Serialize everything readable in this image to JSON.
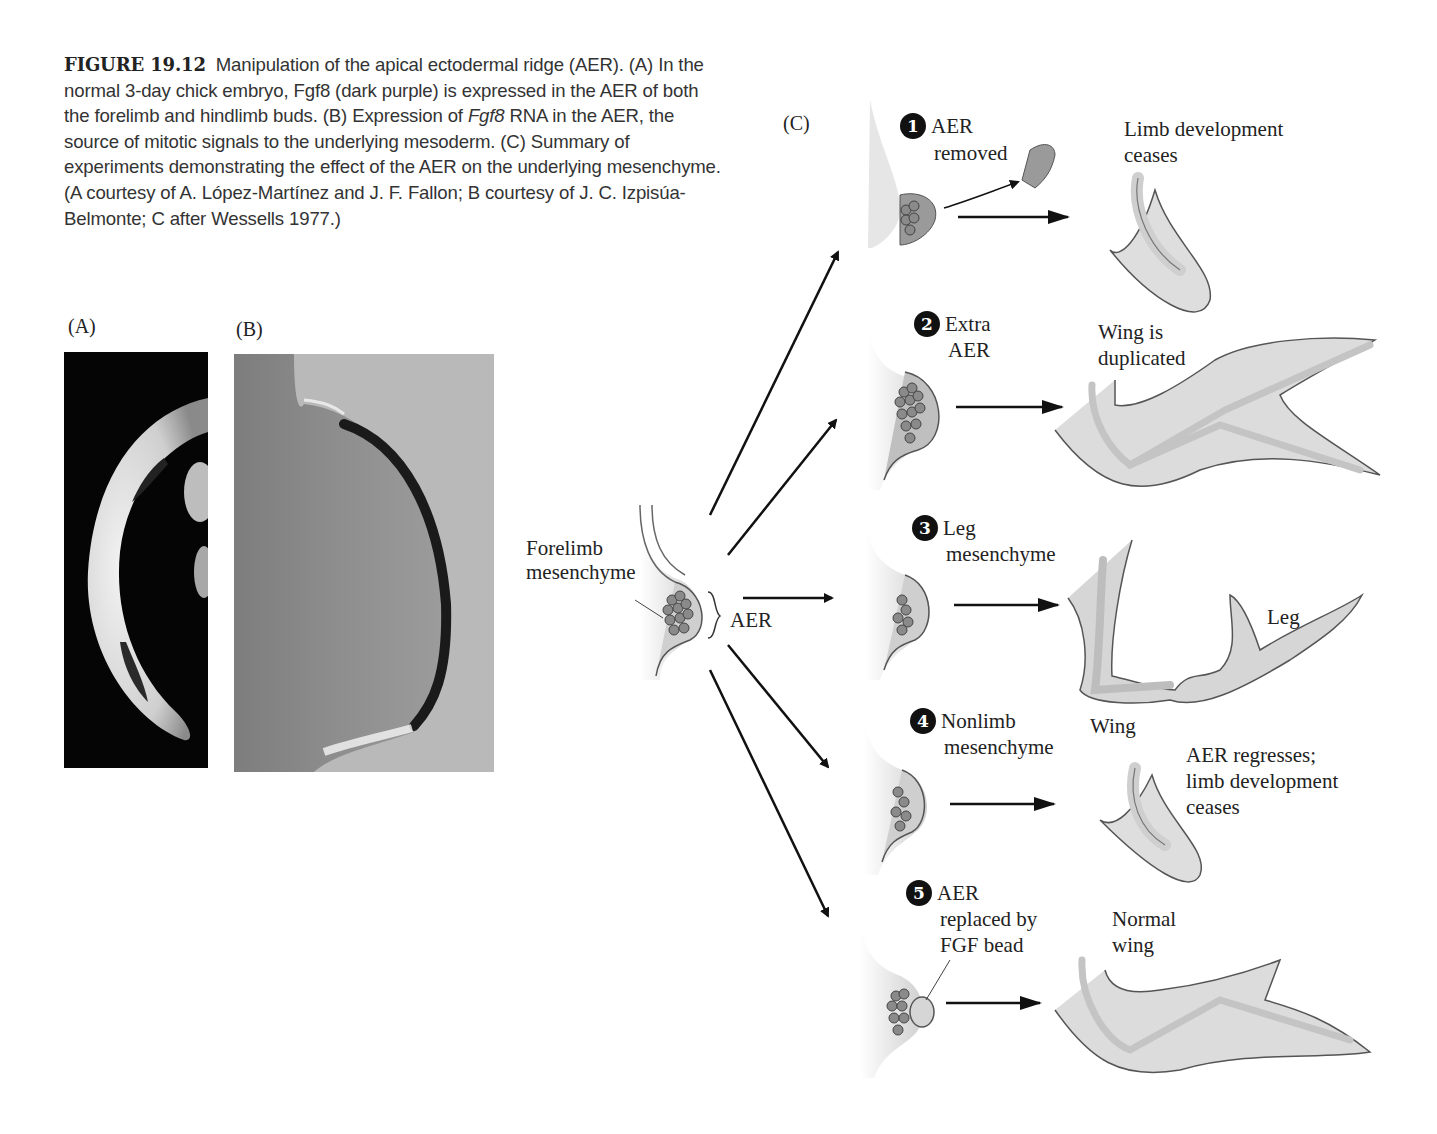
{
  "caption": {
    "figure_number": "FIGURE 19.12",
    "line_1_text": "Manipulation of the apical ectodermal ridge (AER).",
    "part_a": "(A) In the normal 3-day chick embryo, Fgf8 (dark purple) is expressed in the AER of both the forelimb and hindlimb buds.",
    "part_b_prefix": "(B) Expression of",
    "part_b_italic": "Fgf8",
    "part_b_rest": "RNA in the AER, the source of mitotic signals to the underlying mesoderm.",
    "part_c": "(C) Summary of experiments demonstrating the effect of the AER on the underlying mesenchyme.",
    "credits": "(A courtesy of A. López-Martínez and J. F. Fallon; B courtesy of J. C. Izpisúa-Belmonte; C after Wessells 1977.)"
  },
  "panels": {
    "a_label": "(A)",
    "b_label": "(B)",
    "c_label": "(C)"
  },
  "center": {
    "mesenchyme_label_1": "Forelimb",
    "mesenchyme_label_2": "mesenchyme",
    "aer_label": "AER"
  },
  "experiments": [
    {
      "number": "1",
      "label_1": "AER",
      "label_2": "removed",
      "result_1": "Limb development",
      "result_2": "ceases"
    },
    {
      "number": "2",
      "label_1": "Extra",
      "label_2": "AER",
      "result_1": "Wing is",
      "result_2": "duplicated"
    },
    {
      "number": "3",
      "label_1": "Leg",
      "label_2": "mesenchyme",
      "result_1": "Leg",
      "result_2": "Wing"
    },
    {
      "number": "4",
      "label_1": "Nonlimb",
      "label_2": "mesenchyme",
      "result_1": "AER regresses;",
      "result_2": "limb development",
      "result_3": "ceases"
    },
    {
      "number": "5",
      "label_1": "AER",
      "label_2": "replaced by",
      "label_3": "FGF bead",
      "result_1": "Normal",
      "result_2": "wing"
    }
  ],
  "colors": {
    "tissue": "#d9d9d9",
    "tissue_dark": "#9a9a9a",
    "outline": "#555555",
    "arrow": "#111111"
  }
}
